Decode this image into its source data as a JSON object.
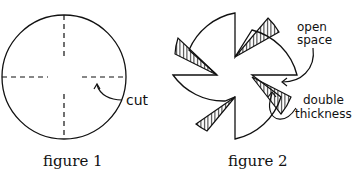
{
  "figure1": {
    "caption": "figure 1",
    "annotation": "cut"
  },
  "figure2": {
    "caption": "figure 2",
    "annotations": {
      "open_space_line1": "open",
      "open_space_line2": "space",
      "double_line1": "double",
      "double_line2": "thickness"
    }
  },
  "colors": {
    "stroke": "#111111",
    "background": "#ffffff"
  }
}
